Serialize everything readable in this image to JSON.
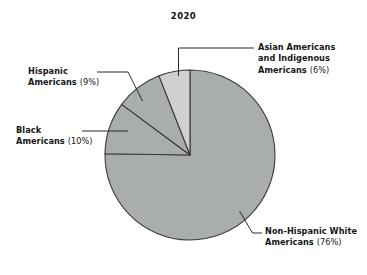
{
  "chart_data": {
    "type": "pie",
    "title": "2020",
    "subtitle": "",
    "xlabel": "",
    "ylabel": "",
    "legend_position": "callout-labels",
    "grid": false,
    "categories": [
      "Non-Hispanic White Americans",
      "Black Americans",
      "Hispanic Americans",
      "Asian Americans and Indigenous Americans"
    ],
    "values": [
      76,
      10,
      9,
      6
    ],
    "units": "percent",
    "slices": [
      {
        "name": "Asian Americans and Indigenous Americans",
        "label_line1": "Asian Americans",
        "label_line2": "and Indigenous",
        "label_line3": "Americans",
        "percent_text": "(6%)",
        "value": 6,
        "color": "#cfd0d0"
      },
      {
        "name": "Hispanic Americans",
        "label_line1": "Hispanic",
        "label_line2": "Americans",
        "percent_text": "(9%)",
        "value": 9,
        "color": "#a9adad"
      },
      {
        "name": "Black Americans",
        "label_line1": "Black",
        "label_line2": "Americans",
        "percent_text": "(10%)",
        "value": 10,
        "color": "#a9adad"
      },
      {
        "name": "Non-Hispanic White Americans",
        "label_line1": "Non-Hispanic White",
        "label_line2": "Americans",
        "percent_text": "(76%)",
        "value": 76,
        "color": "#a9adad"
      }
    ]
  },
  "chart": {
    "title": "2020"
  },
  "callouts": {
    "asian": {
      "line1": "Asian Americans",
      "line2": "and Indigenous",
      "line3": "Americans ",
      "pct": "(6%)"
    },
    "hispanic": {
      "line1": "Hispanic ",
      "line2": "Americans ",
      "pct": "(9%)"
    },
    "black": {
      "line1": "Black ",
      "line2": "Americans ",
      "pct": "(10%)"
    },
    "white": {
      "line1": "Non-Hispanic White",
      "line2": "Americans ",
      "pct": "(76%)"
    }
  },
  "colors": {
    "slice_light": "#cfd0d0",
    "slice_main": "#a9adad",
    "outline": "#3a3a3a",
    "leader": "#2b2b2b",
    "text": "#161616",
    "background": "#ffffff"
  }
}
